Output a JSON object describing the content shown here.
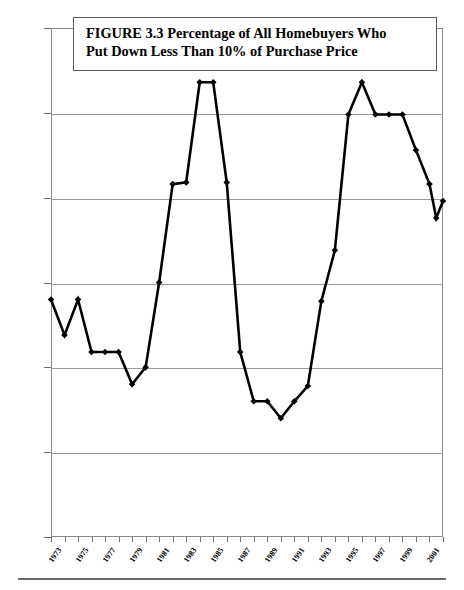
{
  "figure": {
    "title_line1": "FIGURE 3.3  Percentage of All Homebuyers Who",
    "title_line2": "Put Down Less Than 10% of Purchase Price"
  },
  "chart_data": {
    "type": "line",
    "title": "FIGURE 3.3  Percentage of All Homebuyers Who Put Down Less Than 10% of Purchase Price",
    "xlabel": "",
    "ylabel": "Percentage of Loans with at Least 90% Loan to Value Ratio",
    "ylim": [
      0,
      30
    ],
    "xlim": [
      1973,
      2002
    ],
    "yticks": [
      0,
      5,
      10,
      15,
      20,
      25,
      30
    ],
    "ytick_labels": [
      "0",
      "5",
      "10",
      "15",
      "20",
      "25",
      "30"
    ],
    "xtick_labels": [
      "1973",
      "1975",
      "1977",
      "1979",
      "1981",
      "1983",
      "1985",
      "1987",
      "1989",
      "1991",
      "1993",
      "1995",
      "1997",
      "1999",
      "2001"
    ],
    "grid": true,
    "legend": false,
    "marker": "diamond",
    "line_color": "#000000",
    "marker_color": "#000000",
    "x": [
      1973,
      1974,
      1975,
      1976,
      1977,
      1978,
      1979,
      1980,
      1981,
      1982,
      1983,
      1984,
      1985,
      1986,
      1987,
      1988,
      1989,
      1990,
      1991,
      1992,
      1993,
      1994,
      1995,
      1996,
      1997,
      1998,
      1999,
      2000,
      2001,
      2002
    ],
    "values": [
      14.0,
      11.9,
      14.0,
      10.9,
      10.9,
      10.9,
      9.0,
      10.0,
      15.0,
      20.8,
      20.9,
      26.8,
      26.8,
      20.9,
      10.9,
      8.0,
      8.0,
      7.0,
      8.0,
      8.9,
      13.9,
      16.9,
      24.9,
      26.8,
      24.9,
      24.9,
      24.9,
      22.8,
      20.8,
      19.8
    ],
    "series": [
      {
        "name": "Percentage of Loans with at Least 90% Loan to Value Ratio",
        "values": [
          14.0,
          11.9,
          14.0,
          10.9,
          10.9,
          10.9,
          9.0,
          10.0,
          15.0,
          20.8,
          20.9,
          26.8,
          26.8,
          20.9,
          10.9,
          8.0,
          8.0,
          7.0,
          8.0,
          8.9,
          13.9,
          16.9,
          24.9,
          26.8,
          24.9,
          24.9,
          24.9,
          22.8,
          20.8,
          19.8
        ]
      }
    ],
    "note_points": [
      {
        "year": 2001,
        "value": 18.8
      }
    ]
  }
}
